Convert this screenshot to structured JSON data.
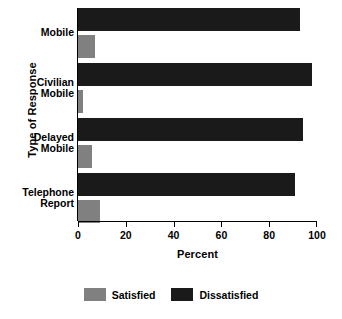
{
  "chart_data": {
    "type": "bar",
    "orientation": "horizontal",
    "title": "",
    "xlabel": "Percent",
    "ylabel": "Type of Response",
    "xlim": [
      0,
      100
    ],
    "xticks": [
      0,
      20,
      40,
      60,
      80,
      100
    ],
    "xtick_labels": [
      "0",
      "20",
      "40",
      "60",
      "80",
      "100"
    ],
    "grid": false,
    "legend_position": "bottom-center",
    "categories": [
      "Mobile",
      "Civilian Mobile",
      "Delayed Mobile",
      "Telephone Report"
    ],
    "category_lines": [
      [
        "Mobile"
      ],
      [
        "Civilian",
        "Mobile"
      ],
      [
        "Delayed",
        "Mobile"
      ],
      [
        "Telephone",
        "Report"
      ]
    ],
    "series": [
      {
        "name": "Dissatisfied",
        "color": "#1a1a1a",
        "values": [
          93,
          98,
          94,
          91
        ]
      },
      {
        "name": "Satisfied",
        "color": "#808080",
        "values": [
          7,
          2,
          6,
          9
        ]
      }
    ]
  },
  "legend": {
    "items": [
      {
        "label": "Satisfied",
        "swatch": "satisfied"
      },
      {
        "label": "Dissatisfied",
        "swatch": "dissatisfied"
      }
    ]
  },
  "colors": {
    "satisfied": "#808080",
    "dissatisfied": "#1a1a1a",
    "axis": "#000000",
    "background": "#ffffff"
  }
}
